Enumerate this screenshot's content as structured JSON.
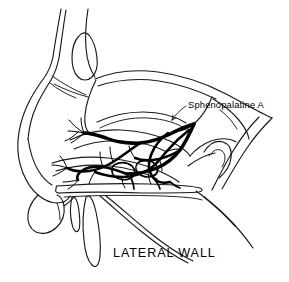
{
  "figure": {
    "kind": "anatomical-line-drawing",
    "background_color": "#ffffff",
    "line_color": "#1a1a1a",
    "vessel_color": "#000000"
  },
  "labels": {
    "artery": "Sphenopalatine  A",
    "title": "LATERAL  WALL"
  },
  "annotations": {
    "leader_from": "Sphenopalatine A label",
    "leader_to": "sphenopalatine artery trunk"
  }
}
